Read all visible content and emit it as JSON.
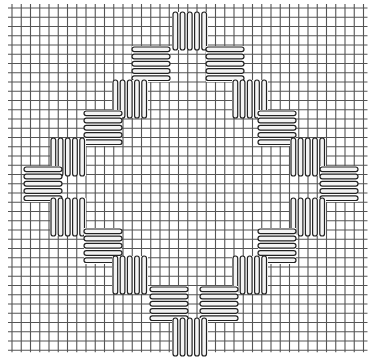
{
  "diagram": {
    "title": "",
    "colors": {
      "background": "#ffffff",
      "grid": "#555555",
      "stitch_outline": "#222222",
      "stitch_fill": "#ffffff"
    },
    "grid": {
      "x0": 12,
      "y0": 8,
      "cell": 9.25,
      "cols": 38,
      "rows": 37
    },
    "stitch_blocks": [
      {
        "orientation": "vertical",
        "x": 172,
        "y": 12,
        "w": 36,
        "h": 38
      },
      {
        "orientation": "horizontal",
        "x": 132,
        "y": 46,
        "w": 38,
        "h": 36
      },
      {
        "orientation": "horizontal",
        "x": 206,
        "y": 46,
        "w": 38,
        "h": 36
      },
      {
        "orientation": "vertical",
        "x": 112,
        "y": 80,
        "w": 36,
        "h": 38
      },
      {
        "orientation": "vertical",
        "x": 232,
        "y": 80,
        "w": 36,
        "h": 38
      },
      {
        "orientation": "horizontal",
        "x": 84,
        "y": 110,
        "w": 38,
        "h": 36
      },
      {
        "orientation": "horizontal",
        "x": 258,
        "y": 110,
        "w": 38,
        "h": 36
      },
      {
        "orientation": "vertical",
        "x": 50,
        "y": 138,
        "w": 36,
        "h": 38
      },
      {
        "orientation": "vertical",
        "x": 290,
        "y": 138,
        "w": 36,
        "h": 38
      },
      {
        "orientation": "horizontal",
        "x": 24,
        "y": 166,
        "w": 38,
        "h": 36
      },
      {
        "orientation": "horizontal",
        "x": 320,
        "y": 166,
        "w": 38,
        "h": 36
      },
      {
        "orientation": "vertical",
        "x": 50,
        "y": 198,
        "w": 36,
        "h": 38
      },
      {
        "orientation": "vertical",
        "x": 290,
        "y": 198,
        "w": 36,
        "h": 38
      },
      {
        "orientation": "horizontal",
        "x": 84,
        "y": 228,
        "w": 38,
        "h": 36
      },
      {
        "orientation": "horizontal",
        "x": 258,
        "y": 228,
        "w": 38,
        "h": 36
      },
      {
        "orientation": "vertical",
        "x": 112,
        "y": 256,
        "w": 36,
        "h": 38
      },
      {
        "orientation": "vertical",
        "x": 232,
        "y": 256,
        "w": 36,
        "h": 38
      },
      {
        "orientation": "horizontal",
        "x": 150,
        "y": 286,
        "w": 38,
        "h": 36
      },
      {
        "orientation": "horizontal",
        "x": 200,
        "y": 286,
        "w": 38,
        "h": 36
      },
      {
        "orientation": "vertical",
        "x": 172,
        "y": 318,
        "w": 36,
        "h": 38
      }
    ],
    "stitches_per_block": 5
  }
}
